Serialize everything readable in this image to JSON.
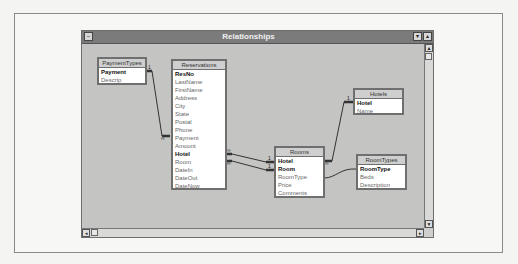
{
  "window": {
    "title": "Relationships",
    "controls": {
      "system_menu": "−",
      "minimize": "▾",
      "maximize": "▴"
    }
  },
  "tables": [
    {
      "name": "PaymentTypes",
      "fields": [
        {
          "name": "Payment",
          "key": true
        },
        {
          "name": "Descrip",
          "key": false
        }
      ]
    },
    {
      "name": "Reservations",
      "fields": [
        {
          "name": "ResNo",
          "key": true
        },
        {
          "name": "LastName",
          "key": false
        },
        {
          "name": "FirstName",
          "key": false
        },
        {
          "name": "Address",
          "key": false
        },
        {
          "name": "City",
          "key": false
        },
        {
          "name": "State",
          "key": false
        },
        {
          "name": "Postal",
          "key": false
        },
        {
          "name": "Phone",
          "key": false
        },
        {
          "name": "Payment",
          "key": false
        },
        {
          "name": "Amount",
          "key": false
        },
        {
          "name": "Hotel",
          "key": true
        },
        {
          "name": "Room",
          "key": false
        },
        {
          "name": "DateIn",
          "key": false
        },
        {
          "name": "DateOut",
          "key": false
        },
        {
          "name": "DateNow",
          "key": false
        }
      ]
    },
    {
      "name": "Hotels",
      "fields": [
        {
          "name": "Hotel",
          "key": true
        },
        {
          "name": "Name",
          "key": false
        }
      ]
    },
    {
      "name": "Rooms",
      "fields": [
        {
          "name": "Hotel",
          "key": true
        },
        {
          "name": "Room",
          "key": true
        },
        {
          "name": "RoomType",
          "key": false
        },
        {
          "name": "Price",
          "key": false
        },
        {
          "name": "Comments",
          "key": false
        }
      ]
    },
    {
      "name": "RoomTypes",
      "fields": [
        {
          "name": "RoomType",
          "key": true
        },
        {
          "name": "Beds",
          "key": false
        },
        {
          "name": "Description",
          "key": false
        }
      ]
    }
  ],
  "relationships": [
    {
      "from": "PaymentTypes.Payment",
      "to": "Reservations.Payment",
      "one": "1",
      "many": "∞"
    },
    {
      "from": "Rooms.Hotel",
      "to": "Reservations.Hotel",
      "one": "1",
      "many": "∞"
    },
    {
      "from": "Rooms.Room",
      "to": "Reservations.Room",
      "one": "1",
      "many": "∞"
    },
    {
      "from": "Hotels.Hotel",
      "to": "Rooms.Hotel",
      "one": "1",
      "many": "∞"
    },
    {
      "from": "RoomTypes.RoomType",
      "to": "Rooms.RoomType",
      "one": "",
      "many": ""
    }
  ],
  "labels": {
    "one": "1",
    "many": "∞"
  },
  "scroll": {
    "up": "▲",
    "down": "▼",
    "left": "◂",
    "right": "▸"
  }
}
